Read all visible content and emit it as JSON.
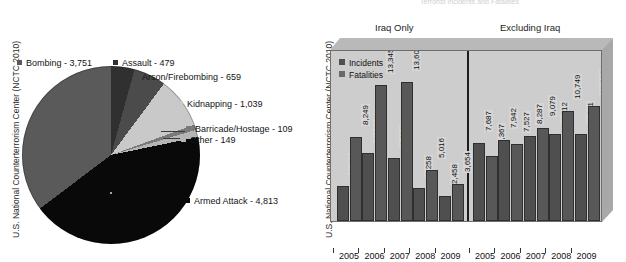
{
  "source_label": "U.S. National Counterterrorism Center (NCTC 2010)",
  "figure_title": "Terrorist Incidents and Fatalities",
  "pie": {
    "legend_marker": "square-marker",
    "labels": {
      "bombing": "Bombing - 3,751",
      "assault": "Assault - 479",
      "arson": "Arson/Firebombing - 659",
      "kidnapping": "Kidnapping - 1,039",
      "barricade": "Barricade/Hostage - 109",
      "other": "Other - 149",
      "armed_attack": "Armed Attack - 4,813"
    }
  },
  "bar": {
    "group_left_title": "Iraq Only",
    "group_right_title": "Excluding Iraq",
    "legend": {
      "incidents": "Incidents",
      "fatalities": "Fatalities"
    },
    "years": [
      "2005",
      "2006",
      "2007",
      "2008",
      "2009",
      "2005",
      "2006",
      "2007",
      "2008",
      "2009"
    ]
  },
  "chart_data": [
    {
      "type": "pie",
      "title": "Terrorist Incidents by Attack Type",
      "ylabel": "",
      "xlabel": "",
      "legend_position": "callout-labels",
      "categories": [
        "Bombing",
        "Assault",
        "Arson/Firebombing",
        "Kidnapping",
        "Barricade/Hostage",
        "Other",
        "Armed Attack"
      ],
      "values": [
        3751,
        479,
        659,
        1039,
        109,
        149,
        4813
      ],
      "value_labels": [
        "3,751",
        "479",
        "659",
        "1,039",
        "109",
        "149",
        "4,813"
      ],
      "colors": [
        "#5a5a5a",
        "#303030",
        "#4b4b4b",
        "#c9c9c9",
        "#7a7a7a",
        "#b5b5b5",
        "#090909"
      ],
      "total": 10999,
      "source": "U.S. National Counterterrorism Center (NCTC 2010)"
    },
    {
      "type": "bar",
      "title": "Terrorist Incidents and Fatalities",
      "xlabel": "",
      "ylabel": "",
      "grid": false,
      "legend_position": "top-left",
      "ylim": [
        0,
        14500
      ],
      "groups": [
        "Iraq Only",
        "Excluding Iraq"
      ],
      "categories": [
        "2005",
        "2006",
        "2007",
        "2008",
        "2009",
        "2005",
        "2006",
        "2007",
        "2008",
        "2009"
      ],
      "series": [
        {
          "name": "Incidents",
          "values": [
            3469,
            6628,
            6212,
            3258,
            2458,
            7687,
            7942,
            8287,
            8512,
            8541
          ],
          "value_labels": [
            "3,469",
            "6,628",
            "6,212",
            "3,258",
            "2,458",
            "7,687",
            "7,942",
            "8,287",
            "8,512",
            "8,541"
          ]
        },
        {
          "name": "Fatalities",
          "values": [
            8249,
            13345,
            13606,
            5016,
            3654,
            6367,
            7527,
            9079,
            10749,
            11317
          ],
          "value_labels": [
            "8,249",
            "13,345",
            "13,606",
            "5,016",
            "3,654",
            "6,367",
            "7,527",
            "9,079",
            "10,749",
            "11,317"
          ]
        }
      ],
      "source": "U.S. National Counterterrorism Center (NCTC 2010)"
    }
  ]
}
